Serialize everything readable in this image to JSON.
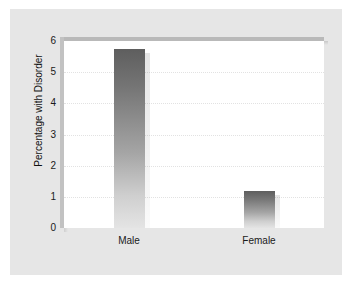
{
  "chart_data": {
    "type": "bar",
    "title": "",
    "subtitle": "",
    "xlabel": "",
    "ylabel": "Percentage with Disorder",
    "categories": [
      "Male",
      "Female"
    ],
    "values": [
      5.75,
      1.2
    ],
    "series": [
      {
        "name": "Percentage with Disorder",
        "values": [
          5.75,
          1.2
        ]
      }
    ],
    "ylim": [
      0,
      6
    ],
    "yticks": [
      "0",
      "1",
      "2",
      "3",
      "4",
      "5",
      "6"
    ],
    "ytick_values": [
      0,
      1,
      2,
      3,
      4,
      5,
      6
    ],
    "grid": "horizontal-dotted",
    "legend": "none",
    "annotations": []
  },
  "style": {
    "figure_background": "#e6e6e6",
    "plot_background": "#ffffff",
    "gridline_color": "#e2e2e2",
    "bar_top_color": "#5e5e5e",
    "bar_bottom_color": "#e4e4e4",
    "axis_rail_color": "#b9b9b9",
    "tick_text_color": "#1a1a1a"
  }
}
